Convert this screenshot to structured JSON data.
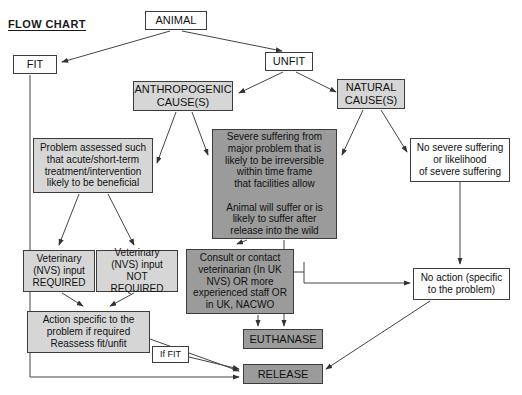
{
  "page": {
    "title": "FLOW CHART",
    "width": 522,
    "height": 395,
    "background": "#ffffff"
  },
  "colors": {
    "white_fill": "#fdfdfd",
    "light_gray_fill": "#d6d6d6",
    "dark_gray_fill": "#9b9b9b",
    "border": "#3c3c3c",
    "text": "#111111",
    "edge": "#444444"
  },
  "nodes": {
    "animal": {
      "label": "ANIMAL",
      "fill": "white",
      "x": 145,
      "y": 11,
      "w": 62,
      "h": 19
    },
    "fit": {
      "label": "FIT",
      "fill": "white",
      "x": 13,
      "y": 55,
      "w": 44,
      "h": 19
    },
    "unfit": {
      "label": "UNFIT",
      "fill": "white",
      "x": 265,
      "y": 52,
      "w": 48,
      "h": 19
    },
    "anthropogenic_cause": {
      "label": "ANTHROPOGENIC\nCAUSE(S)",
      "fill": "light",
      "x": 133,
      "y": 81,
      "w": 100,
      "h": 30
    },
    "natural_cause": {
      "label": "NATURAL\nCAUSE(S)",
      "fill": "light",
      "x": 337,
      "y": 79,
      "w": 68,
      "h": 30
    },
    "problem_assessed": {
      "label": "Problem assessed such\nthat acute/short-term\ntreatment/intervention\nlikely to be beneficial",
      "fill": "light",
      "x": 33,
      "y": 138,
      "w": 120,
      "h": 55
    },
    "severe_suffering": {
      "label": "Severe suffering from\nmajor problem that is\nlikely to be irreversible\nwithin time frame\nthat facilities allow\n\nAnimal will suffer or is\nlikely to suffer after\nrelease into the wild",
      "fill": "dark",
      "x": 212,
      "y": 129,
      "w": 125,
      "h": 110
    },
    "no_severe_suffering": {
      "label": "No severe suffering\nor likelihood\nof severe suffering",
      "fill": "white",
      "x": 410,
      "y": 138,
      "w": 100,
      "h": 44
    },
    "vet_required": {
      "label": "Veterinary\n(NVS) input\nREQUIRED",
      "fill": "light",
      "x": 23,
      "y": 250,
      "w": 72,
      "h": 42
    },
    "vet_not_required": {
      "label": "Veterinary\n(NVS) input\nNOT REQUIRED",
      "fill": "light",
      "x": 96,
      "y": 250,
      "w": 82,
      "h": 42
    },
    "consult_vet": {
      "label": "Consult or contact\nveterinarian (In UK\nNVS) OR more\nexperienced staff OR\nin UK, NACWO",
      "fill": "dark",
      "x": 186,
      "y": 249,
      "w": 108,
      "h": 65
    },
    "no_action": {
      "label": "No action (specific\nto the problem)",
      "fill": "white",
      "x": 413,
      "y": 268,
      "w": 97,
      "h": 32
    },
    "action_specific": {
      "label": "Action specific to the\nproblem if required\nReassess fit/unfit",
      "fill": "light",
      "x": 27,
      "y": 311,
      "w": 123,
      "h": 42
    },
    "if_fit": {
      "label": "If FIT",
      "fill": "white",
      "x": 152,
      "y": 346,
      "w": 37,
      "h": 17
    },
    "euthanase": {
      "label": "EUTHANASE",
      "fill": "dark",
      "x": 243,
      "y": 329,
      "w": 80,
      "h": 20
    },
    "release": {
      "label": "RELEASE",
      "fill": "dark",
      "x": 243,
      "y": 364,
      "w": 80,
      "h": 20
    }
  },
  "edges": [
    {
      "name": "animal-to-fit",
      "from": "animal",
      "to": "fit"
    },
    {
      "name": "animal-to-unfit",
      "from": "animal",
      "to": "unfit"
    },
    {
      "name": "unfit-to-anthropogenic",
      "from": "unfit",
      "to": "anthropogenic_cause"
    },
    {
      "name": "unfit-to-natural",
      "from": "unfit",
      "to": "natural_cause"
    },
    {
      "name": "anthropogenic-to-problem-assessed",
      "from": "anthropogenic_cause",
      "to": "problem_assessed"
    },
    {
      "name": "anthropogenic-to-severe-suffering",
      "from": "anthropogenic_cause",
      "to": "severe_suffering"
    },
    {
      "name": "natural-to-severe-suffering",
      "from": "natural_cause",
      "to": "severe_suffering"
    },
    {
      "name": "natural-to-no-severe-suffering",
      "from": "natural_cause",
      "to": "no_severe_suffering"
    },
    {
      "name": "problem-to-vet-required",
      "from": "problem_assessed",
      "to": "vet_required"
    },
    {
      "name": "problem-to-vet-not-required",
      "from": "problem_assessed",
      "to": "vet_not_required"
    },
    {
      "name": "vet-required-to-action",
      "from": "vet_required",
      "to": "action_specific"
    },
    {
      "name": "vet-not-required-to-action",
      "from": "vet_not_required",
      "to": "action_specific"
    },
    {
      "name": "severe-suffering-to-consult",
      "from": "severe_suffering",
      "to": "consult_vet"
    },
    {
      "name": "severe-suffering-to-euthanase",
      "from": "severe_suffering",
      "to": "euthanase"
    },
    {
      "name": "consult-to-euthanase",
      "from": "consult_vet",
      "to": "euthanase"
    },
    {
      "name": "consult-to-no-action",
      "from": "consult_vet",
      "to": "no_action"
    },
    {
      "name": "no-severe-suffering-to-no-action",
      "from": "no_severe_suffering",
      "to": "no_action"
    },
    {
      "name": "no-action-to-release",
      "from": "no_action",
      "to": "release"
    },
    {
      "name": "action-to-release",
      "from": "action_specific",
      "to": "release"
    },
    {
      "name": "if-fit-to-release",
      "from": "if_fit",
      "to": "release"
    },
    {
      "name": "fit-to-release",
      "from": "fit",
      "to": "release"
    }
  ]
}
